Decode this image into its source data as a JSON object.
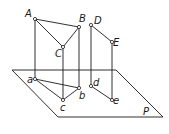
{
  "diagram": {
    "type": "orthographic-projection",
    "plane": {
      "label": "P",
      "corners": [
        [
          12,
          70
        ],
        [
          116,
          70
        ],
        [
          163,
          117
        ],
        [
          58,
          117
        ]
      ],
      "label_pos": [
        143,
        115
      ]
    },
    "points_upper": [
      {
        "id": "A",
        "label": "A",
        "xy": [
          35,
          19
        ],
        "label_pos": [
          25,
          17
        ]
      },
      {
        "id": "B",
        "label": "B",
        "xy": [
          79,
          27
        ],
        "label_pos": [
          79,
          22
        ]
      },
      {
        "id": "C",
        "label": "C",
        "xy": [
          63,
          47
        ],
        "label_pos": [
          55,
          57
        ]
      },
      {
        "id": "D",
        "label": "D",
        "xy": [
          91,
          25
        ],
        "label_pos": [
          94,
          24
        ]
      },
      {
        "id": "E",
        "label": "E",
        "xy": [
          112,
          42
        ],
        "label_pos": [
          113,
          46
        ]
      }
    ],
    "points_projected": [
      {
        "id": "a",
        "label": "a",
        "xy": [
          35,
          79
        ],
        "label_pos": [
          27,
          83
        ]
      },
      {
        "id": "b",
        "label": "b",
        "xy": [
          79,
          88
        ],
        "label_pos": [
          79,
          99
        ]
      },
      {
        "id": "c",
        "label": "c",
        "xy": [
          63,
          100
        ],
        "label_pos": [
          60,
          111
        ]
      },
      {
        "id": "d",
        "label": "d",
        "xy": [
          91,
          86
        ],
        "label_pos": [
          93,
          86
        ]
      },
      {
        "id": "e",
        "label": "e",
        "xy": [
          112,
          100
        ],
        "label_pos": [
          113,
          104
        ]
      }
    ],
    "edges": [
      [
        "A",
        "B"
      ],
      [
        "A",
        "C"
      ],
      [
        "B",
        "C"
      ],
      [
        "D",
        "E"
      ],
      [
        "a",
        "b"
      ],
      [
        "a",
        "c"
      ],
      [
        "b",
        "c"
      ],
      [
        "d",
        "e"
      ]
    ],
    "projectors": [
      [
        "A",
        "a"
      ],
      [
        "B",
        "b"
      ],
      [
        "C",
        "c"
      ],
      [
        "D",
        "d"
      ],
      [
        "E",
        "e"
      ]
    ]
  }
}
